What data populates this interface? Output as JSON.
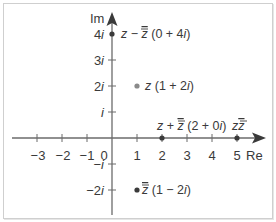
{
  "diagram": {
    "type": "complex-plane",
    "axes": {
      "x_label": "Re",
      "y_label": "Im",
      "x_ticks": [
        {
          "value": -3,
          "label": "−3"
        },
        {
          "value": -2,
          "label": "−2"
        },
        {
          "value": -1,
          "label": "−1"
        },
        {
          "value": 0,
          "label": "0"
        },
        {
          "value": 1,
          "label": "1"
        },
        {
          "value": 2,
          "label": "2"
        },
        {
          "value": 3,
          "label": "3"
        },
        {
          "value": 4,
          "label": "4"
        },
        {
          "value": 5,
          "label": "5"
        }
      ],
      "y_ticks": [
        {
          "value": 4,
          "label_num": "4",
          "label_i": "i"
        },
        {
          "value": 3,
          "label_num": "3",
          "label_i": "i"
        },
        {
          "value": 2,
          "label_num": "2",
          "label_i": "i"
        },
        {
          "value": 1,
          "label_num": "",
          "label_i": "i"
        },
        {
          "value": -1,
          "label_num": "−",
          "label_i": "i"
        },
        {
          "value": -2,
          "label_num": "−2",
          "label_i": "i"
        }
      ]
    },
    "points": [
      {
        "id": "z-minus-zbar",
        "re": 0,
        "im": 4,
        "label_expr": "z − z̅",
        "label_value": "(0 + 4i)",
        "color": "#3a3a3a"
      },
      {
        "id": "z",
        "re": 1,
        "im": 2,
        "label_expr": "z",
        "label_value": "(1 + 2i)",
        "color": "#8a8a8a"
      },
      {
        "id": "z-plus-zbar",
        "re": 2,
        "im": 0,
        "label_expr": "z + z̅",
        "label_value": "(2 + 0i)",
        "color": "#3a3a3a"
      },
      {
        "id": "z-zbar",
        "re": 5,
        "im": 0,
        "label_expr": "z z̅",
        "label_value": "",
        "color": "#3a3a3a"
      },
      {
        "id": "zbar",
        "re": 1,
        "im": -2,
        "label_expr": "z̅",
        "label_value": "(1 − 2i)",
        "color": "#3a3a3a"
      }
    ],
    "colors": {
      "axis": "#6b6b6b",
      "text": "#3a3a3a",
      "frame": "#cfcfcf",
      "highlight_point": "#8a8a8a"
    }
  }
}
